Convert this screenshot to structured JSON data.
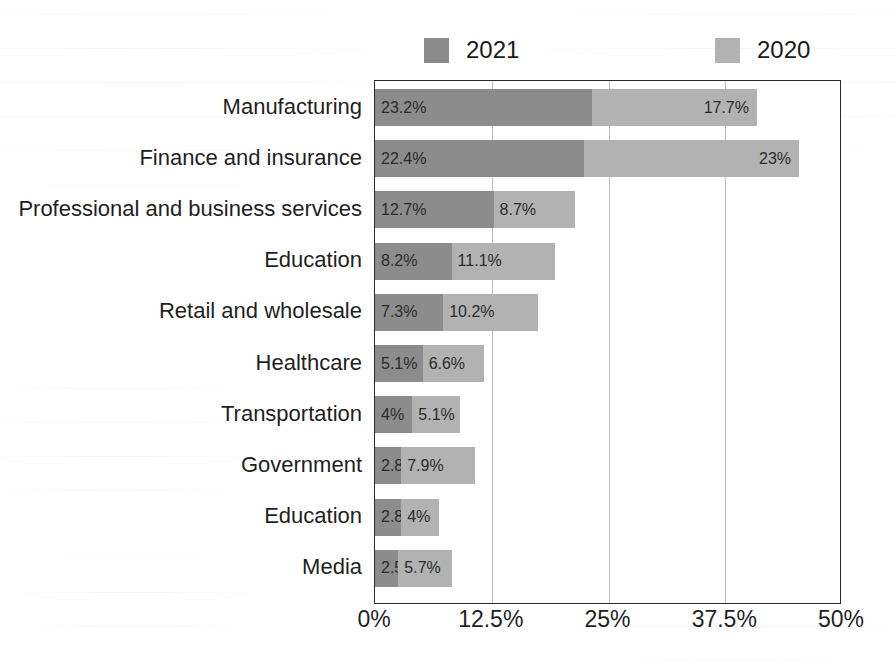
{
  "chart_data": {
    "type": "bar",
    "subtype": "stacked-horizontal-bar",
    "title": "",
    "subtitle": "",
    "xlabel": "",
    "ylabel": "",
    "xlim": [
      0,
      50
    ],
    "xunit": "%",
    "grid": true,
    "grid_axis": "x",
    "legend_position": "top",
    "orientation": "horizontal",
    "categories": [
      "Manufacturing",
      "Finance and insurance",
      "Professional and business services",
      "Education",
      "Retail and wholesale",
      "Healthcare",
      "Transportation",
      "Government",
      "Education",
      "Media"
    ],
    "series": [
      {
        "name": "2021",
        "color": "#8c8c8c",
        "values": [
          23.2,
          22.4,
          12.7,
          8.2,
          7.3,
          5.1,
          4,
          2.8,
          2.8,
          2.5
        ],
        "labels": [
          "23.2%",
          "22.4%",
          "12.7%",
          "8.2%",
          "7.3%",
          "5.1%",
          "4%",
          "2.8%",
          "2.8%",
          "2.5%"
        ]
      },
      {
        "name": "2020",
        "color": "#b2b2b2",
        "values": [
          17.7,
          23,
          8.7,
          11.1,
          10.2,
          6.6,
          5.1,
          7.9,
          4,
          5.7
        ],
        "labels": [
          "17.7%",
          "23%",
          "8.7%",
          "11.1%",
          "10.2%",
          "6.6%",
          "5.1%",
          "7.9%",
          "4%",
          "5.7%"
        ]
      }
    ],
    "xticks": [
      0,
      12.5,
      25,
      37.5,
      50
    ],
    "xtick_labels": [
      "0%",
      "12.5%",
      "25%",
      "37.5%",
      "50%"
    ]
  },
  "legend": {
    "entries": [
      {
        "label": "2021",
        "color": "#8c8c8c"
      },
      {
        "label": "2020",
        "color": "#b2b2b2"
      }
    ]
  },
  "colors": {
    "series_2021": "#8c8c8c",
    "series_2020": "#b2b2b2",
    "axis": "#2a2a2a",
    "gridline": "#bdbdbd",
    "text": "#1f1f1f",
    "background": "#ffffff"
  }
}
